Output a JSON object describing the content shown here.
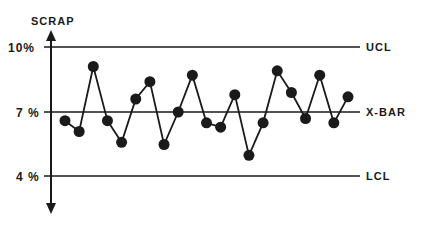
{
  "chart_data": {
    "type": "line",
    "title": "",
    "ylabel": "SCRAP",
    "xlabel": "",
    "ylim": [
      3,
      11
    ],
    "y_ticks": [
      {
        "value": 4,
        "label": "4 %"
      },
      {
        "value": 7,
        "label": "7 %"
      },
      {
        "value": 10,
        "label": "10%"
      }
    ],
    "reference_lines": [
      {
        "name": "UCL",
        "value": 10,
        "label": "UCL"
      },
      {
        "name": "X-BAR",
        "value": 7,
        "label": "X-BAR"
      },
      {
        "name": "LCL",
        "value": 4,
        "label": "LCL"
      }
    ],
    "grid": false,
    "legend": "none",
    "series": [
      {
        "name": "Scrap %",
        "x": [
          1,
          2,
          3,
          4,
          5,
          6,
          7,
          8,
          9,
          10,
          11,
          12,
          13,
          14,
          15,
          16,
          17,
          18,
          19,
          20,
          21
        ],
        "values": [
          6.6,
          6.1,
          9.1,
          6.6,
          5.6,
          7.6,
          8.4,
          5.5,
          7.0,
          8.7,
          6.5,
          6.3,
          7.8,
          5.0,
          6.5,
          8.9,
          7.9,
          6.7,
          8.7,
          6.5,
          7.7
        ]
      }
    ]
  },
  "labels": {
    "y_axis_title": "SCRAP",
    "tick_10": "10%",
    "tick_7": "7 %",
    "tick_4": "4 %",
    "ucl": "UCL",
    "xbar": "X-BAR",
    "lcl": "LCL"
  }
}
